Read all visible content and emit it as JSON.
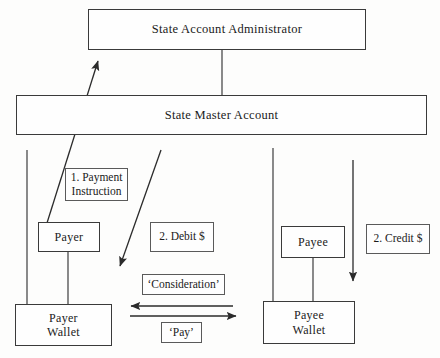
{
  "diagram": {
    "nodes": {
      "state_account_administrator": "State Account Administrator",
      "state_master_account": "State Master Account",
      "payer": "Payer",
      "payee": "Payee",
      "payer_wallet": "Payer\nWallet",
      "payee_wallet": "Payee\nWallet"
    },
    "labels": {
      "payment_instruction": "1. Payment\nInstruction",
      "debit": "2. Debit $",
      "credit": "2. Credit $",
      "consideration": "‘Consideration’",
      "pay": "‘Pay’"
    },
    "connectors": [
      {
        "name": "admin-to-master-link",
        "type": "line",
        "from": "state_account_administrator",
        "to": "state_master_account"
      },
      {
        "name": "payer-instruction-arrow",
        "type": "arrow",
        "from": "payer",
        "to": "state_account_administrator",
        "label": "1. Payment Instruction"
      },
      {
        "name": "debit-arrow",
        "type": "arrow",
        "from": "state_master_account",
        "to": "payer_wallet",
        "label": "2. Debit $"
      },
      {
        "name": "credit-arrow",
        "type": "arrow",
        "from": "state_master_account",
        "to": "payee_wallet",
        "label": "2. Credit $"
      },
      {
        "name": "master-to-payer-line",
        "type": "line",
        "from": "state_master_account",
        "to": "payer_wallet"
      },
      {
        "name": "master-to-payee-line",
        "type": "line",
        "from": "state_master_account",
        "to": "payee_wallet"
      },
      {
        "name": "payer-to-payer-wallet-line",
        "type": "line",
        "from": "payer",
        "to": "payer_wallet"
      },
      {
        "name": "payee-to-payee-wallet-line",
        "type": "line",
        "from": "payee",
        "to": "payee_wallet"
      },
      {
        "name": "consideration-arrow",
        "type": "arrow",
        "from": "payee_wallet",
        "to": "payer_wallet",
        "label": "‘Consideration’"
      },
      {
        "name": "pay-arrow",
        "type": "arrow",
        "from": "payer_wallet",
        "to": "payee_wallet",
        "label": "‘Pay’"
      }
    ],
    "colors": {
      "stroke": "#2b2b2b",
      "box_border": "#3a3a3a",
      "background": "#fdfdfc",
      "text": "#1a1a1a"
    }
  }
}
